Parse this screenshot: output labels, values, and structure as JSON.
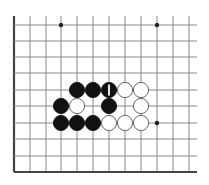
{
  "board": {
    "description": "Go board fragment (lower-left corner region) with stones",
    "colors": {
      "background": "#ffffff",
      "grid": "#888888",
      "edge": "#444444",
      "black_stone": "#111111",
      "white_stone": "#ffffff",
      "white_stone_outline": "#555555",
      "marker": "#ffffff"
    },
    "grid": {
      "columns_x": [
        14,
        30,
        46,
        61,
        77,
        93,
        109,
        125,
        141,
        157,
        173,
        189
      ],
      "rows_y": [
        25,
        41,
        57,
        73,
        90,
        106,
        123,
        139,
        156,
        172
      ],
      "top_y": 16,
      "right_x": 197,
      "left_edge_x": 14,
      "bottom_edge_y": 172
    },
    "star_points": [
      {
        "col": 3,
        "row": 0
      },
      {
        "col": 9,
        "row": 0
      },
      {
        "col": 9,
        "row": 6
      }
    ],
    "stones": [
      {
        "color": "black",
        "col": 4,
        "row": 4
      },
      {
        "color": "black",
        "col": 5,
        "row": 4
      },
      {
        "color": "black",
        "col": 6,
        "row": 4,
        "label": "1"
      },
      {
        "color": "white",
        "col": 7,
        "row": 4
      },
      {
        "color": "white",
        "col": 8,
        "row": 4
      },
      {
        "color": "black",
        "col": 3,
        "row": 5
      },
      {
        "color": "white",
        "col": 4,
        "row": 5
      },
      {
        "color": "black",
        "col": 6,
        "row": 5
      },
      {
        "color": "white",
        "col": 8,
        "row": 5
      },
      {
        "color": "black",
        "col": 3,
        "row": 6
      },
      {
        "color": "black",
        "col": 4,
        "row": 6
      },
      {
        "color": "black",
        "col": 5,
        "row": 6
      },
      {
        "color": "white",
        "col": 6,
        "row": 6
      },
      {
        "color": "white",
        "col": 7,
        "row": 6
      },
      {
        "color": "white",
        "col": 8,
        "row": 6
      }
    ],
    "stone_radius": 7.6
  }
}
